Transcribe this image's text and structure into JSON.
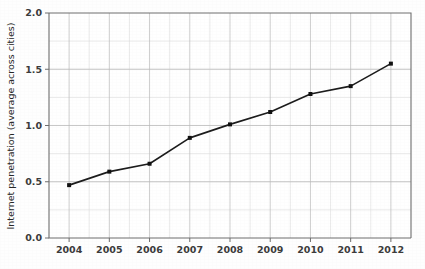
{
  "chart_data": {
    "type": "line",
    "title": "",
    "xlabel": "",
    "ylabel": "Internet penetration (average across cities)",
    "categories": [
      "2004",
      "2005",
      "2006",
      "2007",
      "2008",
      "2009",
      "2010",
      "2011",
      "2012"
    ],
    "values": [
      0.47,
      0.59,
      0.66,
      0.89,
      1.01,
      1.12,
      1.28,
      1.35,
      1.55
    ],
    "series": [
      {
        "name": "Internet penetration",
        "values": [
          0.47,
          0.59,
          0.66,
          0.89,
          1.01,
          1.12,
          1.28,
          1.35,
          1.55
        ]
      }
    ],
    "ylim": [
      0.0,
      2.0
    ],
    "ytick_labels": [
      "0.0",
      "0.5",
      "1.0",
      "1.5",
      "2.0"
    ],
    "ytick_values": [
      0.0,
      0.5,
      1.0,
      1.5,
      2.0
    ],
    "ygrid_minor_step": 0.25,
    "xtick_labels": [
      "2004",
      "2005",
      "2006",
      "2007",
      "2008",
      "2009",
      "2010",
      "2011",
      "2012"
    ],
    "grid": true,
    "legend": false,
    "legend_position": "none",
    "marker": "square",
    "line_color": "#1c1c1c",
    "marker_color": "#111111",
    "grid_color": "#b9b9b9",
    "minor_grid_color": "#dcdcdc",
    "axis_color": "#6e6e6e",
    "background_color": "#fefefe"
  },
  "axis": {
    "y_title": "Internet penetration (average across cities)",
    "y_ticks": [
      "2.0",
      "1.5",
      "1.0",
      "0.5",
      "0.0"
    ],
    "x_ticks": [
      "2004",
      "2005",
      "2006",
      "2007",
      "2008",
      "2009",
      "2010",
      "2011",
      "2012"
    ]
  }
}
